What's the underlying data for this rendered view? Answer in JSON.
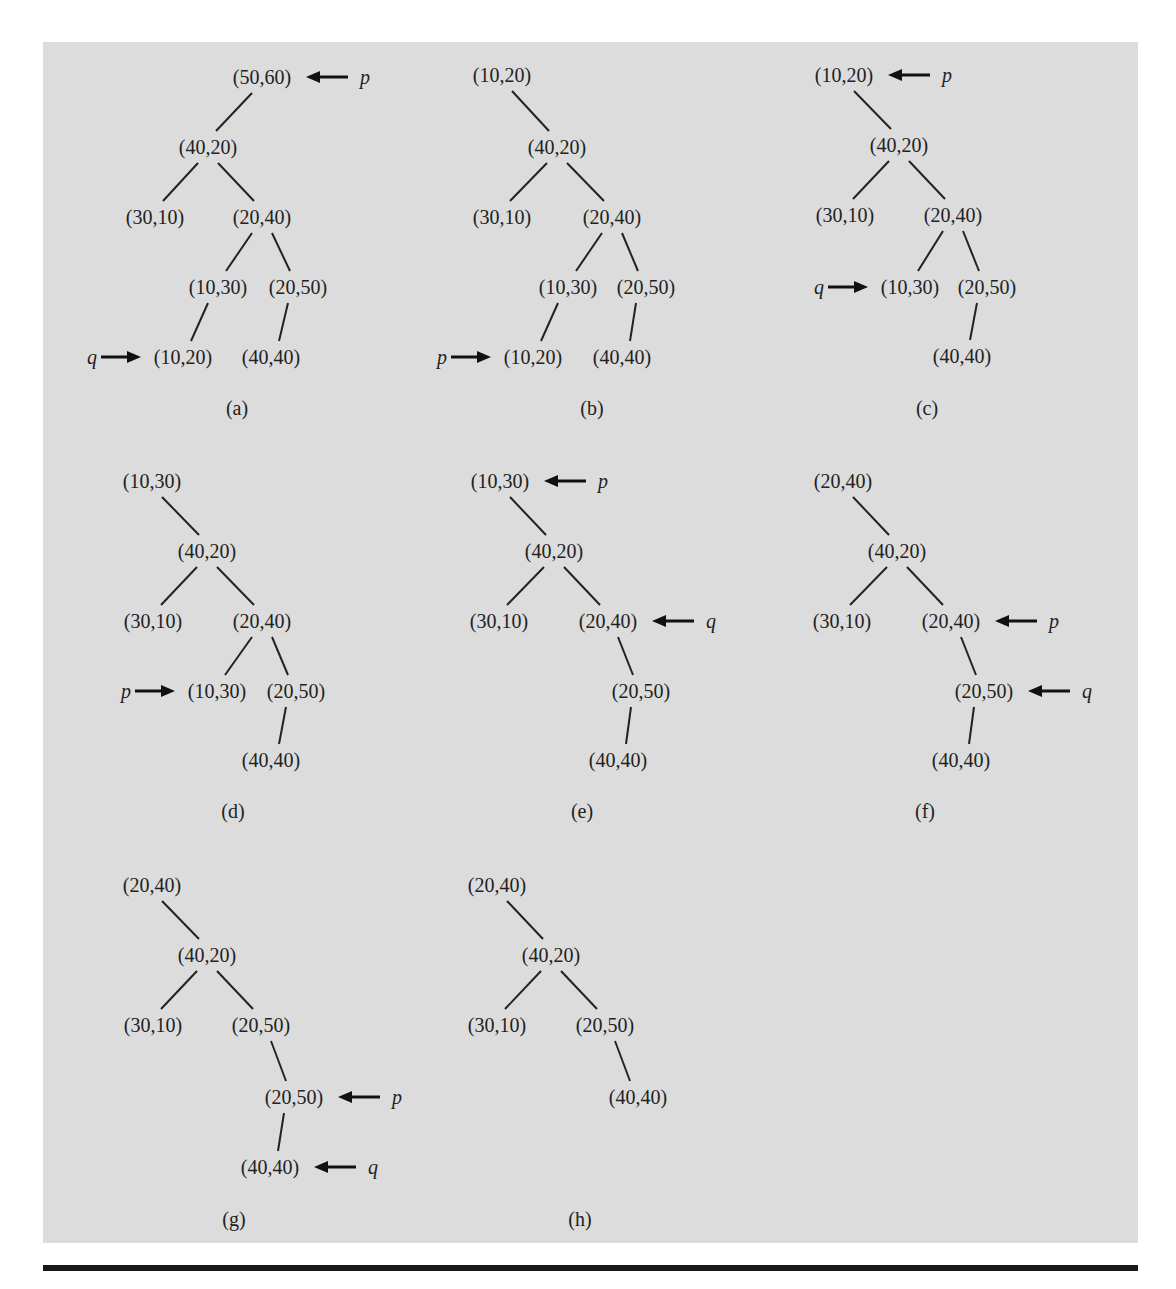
{
  "figure": {
    "background": "#dcdcdc",
    "rule_color": "#1a1a1a",
    "panels": [
      {
        "id": "a",
        "caption": "(a)",
        "caption_pos": [
          237,
          408
        ],
        "nodes": [
          {
            "id": "n1",
            "label": "(50,60)",
            "x": 262,
            "y": 77
          },
          {
            "id": "n2",
            "label": "(40,20)",
            "x": 208,
            "y": 147
          },
          {
            "id": "n3",
            "label": "(30,10)",
            "x": 155,
            "y": 217
          },
          {
            "id": "n4",
            "label": "(20,40)",
            "x": 262,
            "y": 217
          },
          {
            "id": "n5",
            "label": "(10,30)",
            "x": 218,
            "y": 287
          },
          {
            "id": "n6",
            "label": "(20,50)",
            "x": 298,
            "y": 287
          },
          {
            "id": "n7",
            "label": "(10,20)",
            "x": 183,
            "y": 357
          },
          {
            "id": "n8",
            "label": "(40,40)",
            "x": 271,
            "y": 357
          }
        ],
        "edges": [
          [
            "n1",
            "n2"
          ],
          [
            "n2",
            "n3"
          ],
          [
            "n2",
            "n4"
          ],
          [
            "n4",
            "n5"
          ],
          [
            "n4",
            "n6"
          ],
          [
            "n5",
            "n7"
          ],
          [
            "n6",
            "n8"
          ]
        ],
        "pointers": [
          {
            "name": "p",
            "target": "n1",
            "side": "right"
          },
          {
            "name": "q",
            "target": "n7",
            "side": "left"
          }
        ]
      },
      {
        "id": "b",
        "caption": "(b)",
        "caption_pos": [
          592,
          408
        ],
        "nodes": [
          {
            "id": "n1",
            "label": "(10,20)",
            "x": 502,
            "y": 75
          },
          {
            "id": "n2",
            "label": "(40,20)",
            "x": 557,
            "y": 147
          },
          {
            "id": "n3",
            "label": "(30,10)",
            "x": 502,
            "y": 217
          },
          {
            "id": "n4",
            "label": "(20,40)",
            "x": 612,
            "y": 217
          },
          {
            "id": "n5",
            "label": "(10,30)",
            "x": 568,
            "y": 287
          },
          {
            "id": "n6",
            "label": "(20,50)",
            "x": 646,
            "y": 287
          },
          {
            "id": "n7",
            "label": "(10,20)",
            "x": 533,
            "y": 357
          },
          {
            "id": "n8",
            "label": "(40,40)",
            "x": 622,
            "y": 357
          }
        ],
        "edges": [
          [
            "n1",
            "n2"
          ],
          [
            "n2",
            "n3"
          ],
          [
            "n2",
            "n4"
          ],
          [
            "n4",
            "n5"
          ],
          [
            "n4",
            "n6"
          ],
          [
            "n5",
            "n7"
          ],
          [
            "n6",
            "n8"
          ]
        ],
        "pointers": [
          {
            "name": "p",
            "target": "n7",
            "side": "left"
          }
        ]
      },
      {
        "id": "c",
        "caption": "(c)",
        "caption_pos": [
          927,
          408
        ],
        "nodes": [
          {
            "id": "n1",
            "label": "(10,20)",
            "x": 844,
            "y": 75
          },
          {
            "id": "n2",
            "label": "(40,20)",
            "x": 899,
            "y": 145
          },
          {
            "id": "n3",
            "label": "(30,10)",
            "x": 845,
            "y": 215
          },
          {
            "id": "n4",
            "label": "(20,40)",
            "x": 953,
            "y": 215
          },
          {
            "id": "n5",
            "label": "(10,30)",
            "x": 910,
            "y": 287
          },
          {
            "id": "n6",
            "label": "(20,50)",
            "x": 987,
            "y": 287
          },
          {
            "id": "n8",
            "label": "(40,40)",
            "x": 962,
            "y": 356
          }
        ],
        "edges": [
          [
            "n1",
            "n2"
          ],
          [
            "n2",
            "n3"
          ],
          [
            "n2",
            "n4"
          ],
          [
            "n4",
            "n5"
          ],
          [
            "n4",
            "n6"
          ],
          [
            "n6",
            "n8"
          ]
        ],
        "pointers": [
          {
            "name": "p",
            "target": "n1",
            "side": "right"
          },
          {
            "name": "q",
            "target": "n5",
            "side": "left"
          }
        ]
      },
      {
        "id": "d",
        "caption": "(d)",
        "caption_pos": [
          233,
          811
        ],
        "nodes": [
          {
            "id": "n1",
            "label": "(10,30)",
            "x": 152,
            "y": 481
          },
          {
            "id": "n2",
            "label": "(40,20)",
            "x": 207,
            "y": 551
          },
          {
            "id": "n3",
            "label": "(30,10)",
            "x": 153,
            "y": 621
          },
          {
            "id": "n4",
            "label": "(20,40)",
            "x": 262,
            "y": 621
          },
          {
            "id": "n5",
            "label": "(10,30)",
            "x": 217,
            "y": 691
          },
          {
            "id": "n6",
            "label": "(20,50)",
            "x": 296,
            "y": 691
          },
          {
            "id": "n8",
            "label": "(40,40)",
            "x": 271,
            "y": 760
          }
        ],
        "edges": [
          [
            "n1",
            "n2"
          ],
          [
            "n2",
            "n3"
          ],
          [
            "n2",
            "n4"
          ],
          [
            "n4",
            "n5"
          ],
          [
            "n4",
            "n6"
          ],
          [
            "n6",
            "n8"
          ]
        ],
        "pointers": [
          {
            "name": "p",
            "target": "n5",
            "side": "left"
          }
        ]
      },
      {
        "id": "e",
        "caption": "(e)",
        "caption_pos": [
          582,
          811
        ],
        "nodes": [
          {
            "id": "n1",
            "label": "(10,30)",
            "x": 500,
            "y": 481
          },
          {
            "id": "n2",
            "label": "(40,20)",
            "x": 554,
            "y": 551
          },
          {
            "id": "n3",
            "label": "(30,10)",
            "x": 499,
            "y": 621
          },
          {
            "id": "n4",
            "label": "(20,40)",
            "x": 608,
            "y": 621
          },
          {
            "id": "n6",
            "label": "(20,50)",
            "x": 641,
            "y": 691
          },
          {
            "id": "n8",
            "label": "(40,40)",
            "x": 618,
            "y": 760
          }
        ],
        "edges": [
          [
            "n1",
            "n2"
          ],
          [
            "n2",
            "n3"
          ],
          [
            "n2",
            "n4"
          ],
          [
            "n4",
            "n6"
          ],
          [
            "n6",
            "n8"
          ]
        ],
        "pointers": [
          {
            "name": "p",
            "target": "n1",
            "side": "right"
          },
          {
            "name": "q",
            "target": "n4",
            "side": "right"
          }
        ]
      },
      {
        "id": "f",
        "caption": "(f)",
        "caption_pos": [
          925,
          811
        ],
        "nodes": [
          {
            "id": "n1",
            "label": "(20,40)",
            "x": 843,
            "y": 481
          },
          {
            "id": "n2",
            "label": "(40,20)",
            "x": 897,
            "y": 551
          },
          {
            "id": "n3",
            "label": "(30,10)",
            "x": 842,
            "y": 621
          },
          {
            "id": "n4",
            "label": "(20,40)",
            "x": 951,
            "y": 621
          },
          {
            "id": "n6",
            "label": "(20,50)",
            "x": 984,
            "y": 691
          },
          {
            "id": "n8",
            "label": "(40,40)",
            "x": 961,
            "y": 760
          }
        ],
        "edges": [
          [
            "n1",
            "n2"
          ],
          [
            "n2",
            "n3"
          ],
          [
            "n2",
            "n4"
          ],
          [
            "n4",
            "n6"
          ],
          [
            "n6",
            "n8"
          ]
        ],
        "pointers": [
          {
            "name": "p",
            "target": "n4",
            "side": "right"
          },
          {
            "name": "q",
            "target": "n6",
            "side": "right"
          }
        ]
      },
      {
        "id": "g",
        "caption": "(g)",
        "caption_pos": [
          234,
          1219
        ],
        "nodes": [
          {
            "id": "n1",
            "label": "(20,40)",
            "x": 152,
            "y": 885
          },
          {
            "id": "n2",
            "label": "(40,20)",
            "x": 207,
            "y": 955
          },
          {
            "id": "n3",
            "label": "(30,10)",
            "x": 153,
            "y": 1025
          },
          {
            "id": "n4",
            "label": "(20,50)",
            "x": 261,
            "y": 1025
          },
          {
            "id": "n6",
            "label": "(20,50)",
            "x": 294,
            "y": 1097
          },
          {
            "id": "n8",
            "label": "(40,40)",
            "x": 270,
            "y": 1167
          }
        ],
        "edges": [
          [
            "n1",
            "n2"
          ],
          [
            "n2",
            "n3"
          ],
          [
            "n2",
            "n4"
          ],
          [
            "n4",
            "n6"
          ],
          [
            "n6",
            "n8"
          ]
        ],
        "pointers": [
          {
            "name": "p",
            "target": "n6",
            "side": "right"
          },
          {
            "name": "q",
            "target": "n8",
            "side": "right"
          }
        ]
      },
      {
        "id": "h",
        "caption": "(h)",
        "caption_pos": [
          580,
          1219
        ],
        "nodes": [
          {
            "id": "n1",
            "label": "(20,40)",
            "x": 497,
            "y": 885
          },
          {
            "id": "n2",
            "label": "(40,20)",
            "x": 551,
            "y": 955
          },
          {
            "id": "n3",
            "label": "(30,10)",
            "x": 497,
            "y": 1025
          },
          {
            "id": "n4",
            "label": "(20,50)",
            "x": 605,
            "y": 1025
          },
          {
            "id": "n8",
            "label": "(40,40)",
            "x": 638,
            "y": 1097
          }
        ],
        "edges": [
          [
            "n1",
            "n2"
          ],
          [
            "n2",
            "n3"
          ],
          [
            "n2",
            "n4"
          ],
          [
            "n4",
            "n8"
          ]
        ],
        "pointers": []
      }
    ]
  }
}
